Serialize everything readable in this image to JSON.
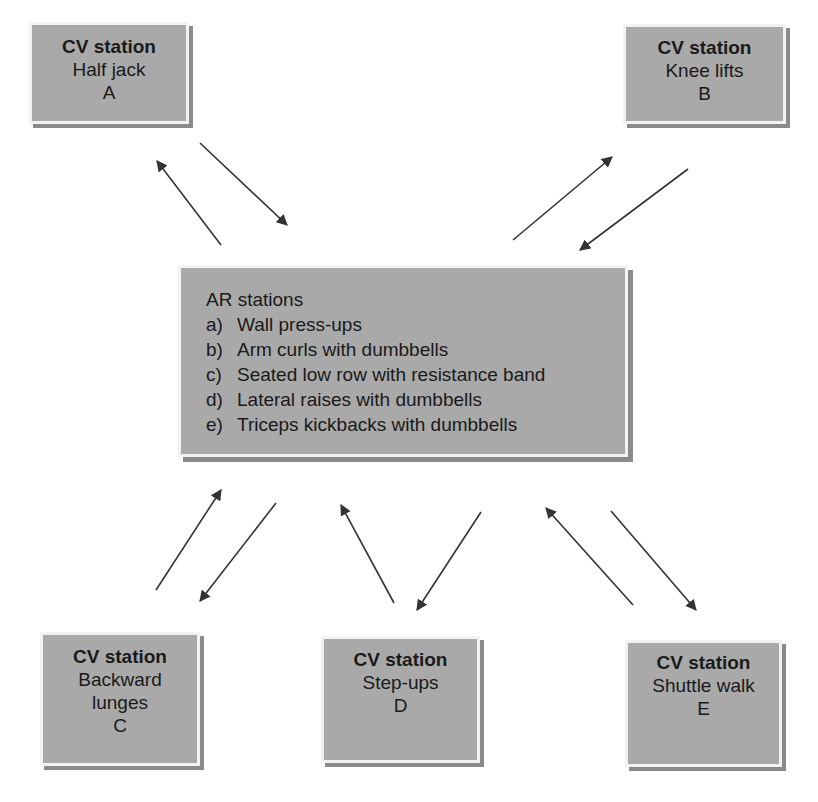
{
  "diagram": {
    "colors": {
      "box_fill": "#a9a9a9",
      "box_border": "#f2f2f2",
      "box_shadow": "#8a8a8a",
      "text": "#1a1a1a",
      "arrow": "#333333"
    },
    "cv_stations": [
      {
        "title": "CV station",
        "name": "Half jack",
        "code": "A"
      },
      {
        "title": "CV station",
        "name": "Knee lifts",
        "code": "B"
      },
      {
        "title": "CV station",
        "name": "Backward lunges",
        "name_lines": [
          "Backward",
          "lunges"
        ],
        "code": "C"
      },
      {
        "title": "CV station",
        "name": "Step-ups",
        "code": "D"
      },
      {
        "title": "CV station",
        "name": "Shuttle walk",
        "code": "E"
      }
    ],
    "ar_stations": {
      "title": "AR stations",
      "items": [
        {
          "label": "a)",
          "text": "Wall press-ups"
        },
        {
          "label": "b)",
          "text": "Arm curls with dumbbells"
        },
        {
          "label": "c)",
          "text": "Seated low row with resistance band"
        },
        {
          "label": "d)",
          "text": "Lateral raises with dumbbells"
        },
        {
          "label": "e)",
          "text": "Triceps kickbacks with dumbbells"
        }
      ]
    },
    "arrows": [
      {
        "from": "AR",
        "to": "A",
        "x1": 221,
        "y1": 245,
        "x2": 157,
        "y2": 161
      },
      {
        "from": "A",
        "to": "AR",
        "x1": 200,
        "y1": 143,
        "x2": 287,
        "y2": 225
      },
      {
        "from": "AR",
        "to": "B",
        "x1": 513,
        "y1": 240,
        "x2": 612,
        "y2": 157
      },
      {
        "from": "B",
        "to": "AR",
        "x1": 688,
        "y1": 169,
        "x2": 580,
        "y2": 250
      },
      {
        "from": "C",
        "to": "AR",
        "x1": 156,
        "y1": 590,
        "x2": 221,
        "y2": 490
      },
      {
        "from": "AR",
        "to": "C",
        "x1": 276,
        "y1": 503,
        "x2": 200,
        "y2": 601
      },
      {
        "from": "D",
        "to": "AR",
        "x1": 394,
        "y1": 603,
        "x2": 341,
        "y2": 505
      },
      {
        "from": "AR",
        "to": "D",
        "x1": 481,
        "y1": 512,
        "x2": 417,
        "y2": 610
      },
      {
        "from": "E",
        "to": "AR",
        "x1": 633,
        "y1": 605,
        "x2": 546,
        "y2": 508
      },
      {
        "from": "AR",
        "to": "E",
        "x1": 611,
        "y1": 511,
        "x2": 696,
        "y2": 610
      }
    ]
  }
}
